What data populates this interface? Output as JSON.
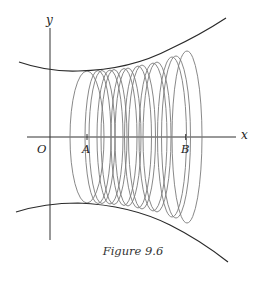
{
  "figure": {
    "caption": "Figure 9.6",
    "labels": {
      "y_axis": "y",
      "x_axis": "x",
      "origin": "O",
      "point_a": "A",
      "point_b": "B"
    },
    "colors": {
      "axes": "#333333",
      "curves": "#2a2a2a",
      "discs": "#777777",
      "background": "#ffffff"
    }
  }
}
